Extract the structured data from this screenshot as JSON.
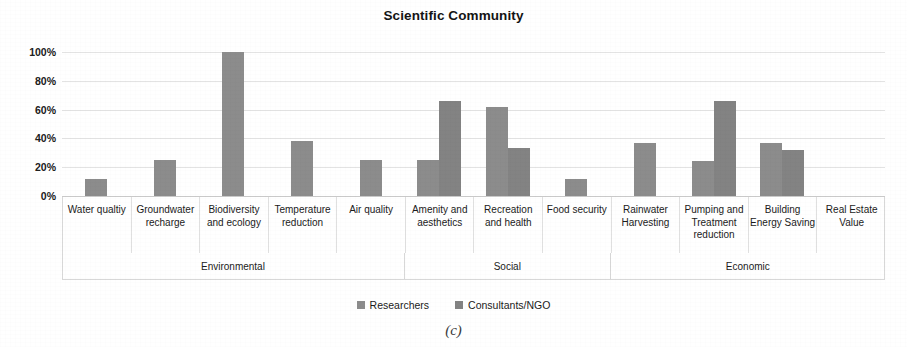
{
  "chart_data": {
    "type": "bar",
    "title": "Scientific Community",
    "xlabel": "",
    "ylabel": "",
    "ylim": [
      0,
      100
    ],
    "ytick_labels": [
      "0%",
      "20%",
      "40%",
      "60%",
      "80%",
      "100%"
    ],
    "ytick_values": [
      0,
      20,
      40,
      60,
      80,
      100
    ],
    "grid": true,
    "legend_position": "bottom",
    "categories": [
      "Water qualtiy",
      "Groundwater recharge",
      "Biodiversity and ecology",
      "Temperature reduction",
      "Air quality",
      "Amenity and aesthetics",
      "Recreation and health",
      "Food security",
      "Rainwater Harvesting",
      "Pumping and Treatment reduction",
      "Building Energy Saving",
      "Real Estate Value"
    ],
    "series": [
      {
        "name": "Researchers",
        "color": "#8c8c8c",
        "values": [
          12,
          25,
          100,
          38,
          25,
          25,
          62,
          12,
          37,
          24,
          37,
          0
        ]
      },
      {
        "name": "Consultants/NGO",
        "color": "#838383",
        "values": [
          0,
          0,
          0,
          0,
          0,
          66,
          33,
          0,
          0,
          66,
          32,
          0
        ]
      }
    ],
    "groups": [
      {
        "label": "Environmental",
        "span": 5
      },
      {
        "label": "Social",
        "span": 3
      },
      {
        "label": "Economic",
        "span": 4
      }
    ],
    "caption": "(c)"
  },
  "legend": {
    "items": [
      {
        "label": "Researchers",
        "color": "#8c8c8c"
      },
      {
        "label": "Consultants/NGO",
        "color": "#838383"
      }
    ]
  },
  "colors": {
    "series_1": "#8c8c8c",
    "series_2": "#838383",
    "gridline": "#e3e3e3",
    "axis": "#c9c9c9",
    "text": "#1a1a1a"
  }
}
